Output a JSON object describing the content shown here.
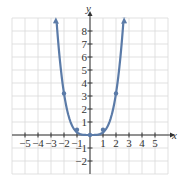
{
  "chart_data": {
    "type": "line",
    "title": "",
    "xlabel": "x",
    "ylabel": "y",
    "xlim": [
      -6,
      6
    ],
    "ylim": [
      -3,
      9
    ],
    "grid": true,
    "x_ticks": [
      "-5",
      "-4",
      "-3",
      "-2",
      "-1",
      "1",
      "2",
      "3",
      "4",
      "5"
    ],
    "y_ticks": [
      "-2",
      "-1",
      "1",
      "2",
      "3",
      "4",
      "5",
      "6",
      "7",
      "8"
    ],
    "series": [
      {
        "name": "curve",
        "color": "#5b7ba8",
        "function": "y = x^4 / 5 approx (flat-bottom U shape)",
        "arrows_at_ends": true,
        "marked_points": [
          {
            "x": -2,
            "y": 3.2
          },
          {
            "x": -1,
            "y": 0.4
          },
          {
            "x": 0,
            "y": 0
          },
          {
            "x": 1,
            "y": 0.4
          },
          {
            "x": 2,
            "y": 3.2
          }
        ]
      }
    ]
  },
  "labels": {
    "x_axis": "x",
    "y_axis": "y",
    "x_ticks": [
      {
        "v": -5,
        "t": "−5"
      },
      {
        "v": -4,
        "t": "−4"
      },
      {
        "v": -3,
        "t": "−3"
      },
      {
        "v": -2,
        "t": "−2"
      },
      {
        "v": -1,
        "t": "−1"
      },
      {
        "v": 1,
        "t": "1"
      },
      {
        "v": 2,
        "t": "2"
      },
      {
        "v": 3,
        "t": "3"
      },
      {
        "v": 4,
        "t": "4"
      },
      {
        "v": 5,
        "t": "5"
      }
    ],
    "y_ticks": [
      {
        "v": 8,
        "t": "8"
      },
      {
        "v": 7,
        "t": "7"
      },
      {
        "v": 6,
        "t": "6"
      },
      {
        "v": 5,
        "t": "5"
      },
      {
        "v": 4,
        "t": "4"
      },
      {
        "v": 3,
        "t": "3"
      },
      {
        "v": 2,
        "t": "2"
      },
      {
        "v": 1,
        "t": "1"
      },
      {
        "v": -1,
        "t": "−1"
      },
      {
        "v": -2,
        "t": "−2"
      }
    ]
  }
}
